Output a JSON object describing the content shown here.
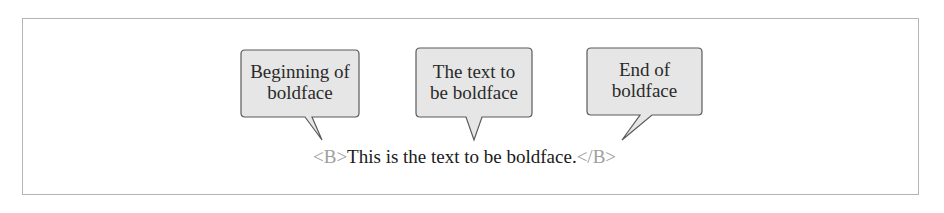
{
  "diagram": {
    "callouts": [
      {
        "id": "begin",
        "line1": "Beginning of",
        "line2": "boldface"
      },
      {
        "id": "middle",
        "line1": "The text to",
        "line2": "be boldface"
      },
      {
        "id": "end",
        "line1": "End of",
        "line2": "boldface"
      }
    ],
    "code": {
      "open_tag": "<B>",
      "content": "This is the text to be boldface.",
      "close_tag": "</B>"
    },
    "colors": {
      "bubble_fill": "#e6e6e6",
      "bubble_stroke": "#5a5a5a",
      "tag_color": "#a0a0a0",
      "frame_color": "#b4b4b4"
    }
  }
}
